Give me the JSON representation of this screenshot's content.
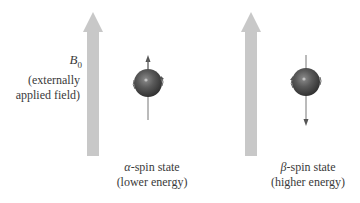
{
  "field": {
    "symbol": "B",
    "subscript": "0",
    "description_line1": "(externally",
    "description_line2": "applied field)",
    "arrow_color": "#c8c8c8"
  },
  "states": [
    {
      "greek": "α",
      "label_suffix": "-spin state",
      "energy": "(lower energy)",
      "spin_direction": "up"
    },
    {
      "greek": "β",
      "label_suffix": "-spin state",
      "energy": "(higher energy)",
      "spin_direction": "down"
    }
  ],
  "colors": {
    "sphere_dark": "#3a3a3a",
    "sphere_light": "#9a9a9a",
    "highlight": "#d8d8d8",
    "spin_axis": "#555555"
  }
}
